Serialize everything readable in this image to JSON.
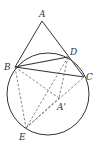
{
  "diagram": {
    "type": "geometry",
    "circle": {
      "cx": 48,
      "cy": 94,
      "r": 41,
      "color": "#333333"
    },
    "points": {
      "A": {
        "x": 42,
        "y": 21,
        "label": "A",
        "lx": 39,
        "ly": 17
      },
      "B": {
        "x": 15,
        "y": 67,
        "label": "B",
        "lx": 4,
        "ly": 70
      },
      "D": {
        "x": 68,
        "y": 57,
        "label": "D",
        "lx": 70,
        "ly": 55
      },
      "C": {
        "x": 84,
        "y": 77,
        "label": "C",
        "lx": 86,
        "ly": 80
      },
      "A'": {
        "x": 59,
        "y": 98,
        "label": "A'",
        "lx": 57,
        "ly": 110
      },
      "E": {
        "x": 26,
        "y": 128,
        "label": "E",
        "lx": 19,
        "ly": 140
      }
    },
    "solid_segments": [
      [
        "A",
        "B"
      ],
      [
        "A",
        "C"
      ],
      [
        "B",
        "D"
      ],
      [
        "B",
        "C"
      ]
    ],
    "dashed_segments": [
      [
        "B",
        "A'"
      ],
      [
        "D",
        "A'"
      ],
      [
        "D",
        "E"
      ],
      [
        "B",
        "E"
      ],
      [
        "E",
        "A'"
      ],
      [
        "E",
        "C"
      ]
    ]
  }
}
